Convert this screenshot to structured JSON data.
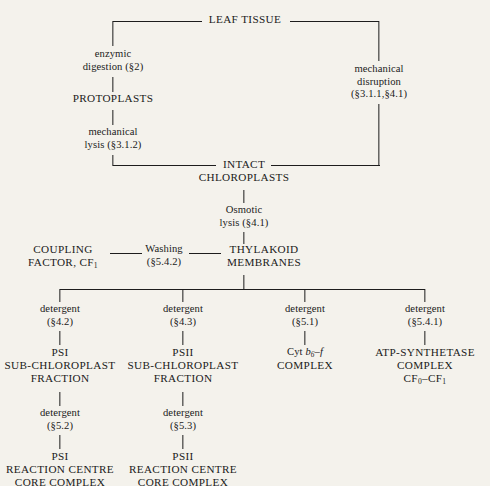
{
  "diagram": {
    "background_color": "#f4f2ec",
    "line_color": "#1d1d1d",
    "text_color": "#1a1a1a",
    "nodes": {
      "leaf_tissue": "LEAF TISSUE",
      "enzymic_digestion_l1": "enzymic",
      "enzymic_digestion_l2": "digestion (§2)",
      "mechanical_disruption_l1": "mechanical",
      "mechanical_disruption_l2": "disruption",
      "mechanical_disruption_l3": "(§3.1.1,§4.1)",
      "protoplasts": "PROTOPLASTS",
      "mechanical_lysis_l1": "mechanical",
      "mechanical_lysis_l2": "lysis (§3.1.2)",
      "intact_chloroplasts_l1": "INTACT",
      "intact_chloroplasts_l2": "CHLOROPLASTS",
      "osmotic_lysis_l1": "Osmotic",
      "osmotic_lysis_l2": "lysis (§4.1)",
      "coupling_factor_l1": "COUPLING",
      "coupling_factor_l2_pre": "FACTOR, CF",
      "coupling_factor_l2_sub": "1",
      "washing_l1": "Washing",
      "washing_l2": "(§5.4.2)",
      "thylakoid_membranes_l1": "THYLAKOID",
      "thylakoid_membranes_l2": "MEMBRANES",
      "detergent_b1_l1": "detergent",
      "detergent_b1_l2": "(§4.2)",
      "detergent_b2_l1": "detergent",
      "detergent_b2_l2": "(§4.3)",
      "detergent_b3_l1": "detergent",
      "detergent_b3_l2": "(§5.1)",
      "detergent_b4_l1": "detergent",
      "detergent_b4_l2": "(§5.4.1)",
      "psi_subchloroplast_l1": "PSI",
      "psi_subchloroplast_l2": "SUB-CHLOROPLAST",
      "psi_subchloroplast_l3": "FRACTION",
      "psii_subchloroplast_l1": "PSII",
      "psii_subchloroplast_l2": "SUB-CHLOROPLAST",
      "psii_subchloroplast_l3": "FRACTION",
      "cyt_b6f_l1_pre": "Cyt ",
      "cyt_b6f_l1_b": "b",
      "cyt_b6f_l1_sub": "6",
      "cyt_b6f_l1_post": "–",
      "cyt_b6f_l1_f": "f",
      "cyt_b6f_l2": "COMPLEX",
      "atp_synthetase_l1": "ATP-SYNTHETASE",
      "atp_synthetase_l2": "COMPLEX",
      "atp_synthetase_l3_pre": "CF",
      "atp_synthetase_l3_sub0": "0",
      "atp_synthetase_l3_dash": "–CF",
      "atp_synthetase_l3_sub1": "1",
      "detergent_b1b_l1": "detergent",
      "detergent_b1b_l2": "(§5.2)",
      "detergent_b2b_l1": "detergent",
      "detergent_b2b_l2": "(§5.3)",
      "psi_rc_l1": "PSI",
      "psi_rc_l2": "REACTION CENTRE",
      "psi_rc_l3": "CORE COMPLEX",
      "psii_rc_l1": "PSII",
      "psii_rc_l2": "REACTION CENTRE",
      "psii_rc_l3": "CORE COMPLEX"
    }
  }
}
